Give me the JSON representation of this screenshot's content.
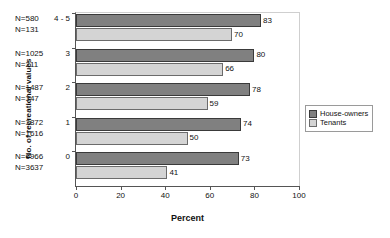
{
  "chart_data": {
    "type": "bar",
    "orientation": "horizontal",
    "title": "",
    "xlabel": "Percent",
    "ylabel": "No. of recreational values",
    "xlim": [
      0,
      100
    ],
    "xticks": [
      0,
      20,
      40,
      60,
      80,
      100
    ],
    "grid": false,
    "legend_position": "right",
    "categories": [
      "4 - 5",
      "3",
      "2",
      "1",
      "0"
    ],
    "series": [
      {
        "name": "House-owners",
        "color": "#808080",
        "values": [
          83,
          80,
          78,
          74,
          73
        ]
      },
      {
        "name": "Tenants",
        "color": "#d4d4d4",
        "values": [
          70,
          66,
          59,
          50,
          41
        ]
      }
    ],
    "group_counts": [
      {
        "category": "4 - 5",
        "house_owners": "N=580",
        "tenants": "N=131"
      },
      {
        "category": "3",
        "house_owners": "N=1025",
        "tenants": "N=211"
      },
      {
        "category": "2",
        "house_owners": "N=1487",
        "tenants": "N=347"
      },
      {
        "category": "1",
        "house_owners": "N=3872",
        "tenants": "N=1616"
      },
      {
        "category": "0",
        "house_owners": "N=6966",
        "tenants": "N=3637"
      }
    ]
  },
  "legend": {
    "items": [
      {
        "label": "House-owners"
      },
      {
        "label": "Tenants"
      }
    ]
  }
}
